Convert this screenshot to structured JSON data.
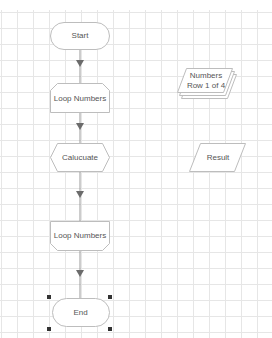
{
  "diagram": {
    "type": "flowchart",
    "colors": {
      "shape_stroke": "#bdbdbd",
      "shape_fill": "#ffffff",
      "connector": "#999999",
      "arrowhead": "#6b6b6b",
      "text": "#555555",
      "grid": "#e6e6e6",
      "selection_handle": "#333333"
    },
    "nodes": [
      {
        "id": "start",
        "shape": "terminator",
        "label": "Start"
      },
      {
        "id": "loop-start",
        "shape": "loop-limit-start",
        "label": "Loop Numbers"
      },
      {
        "id": "calculate",
        "shape": "preparation-hexagon",
        "label": "Calucuate"
      },
      {
        "id": "loop-end",
        "shape": "loop-limit-end",
        "label": "Loop Numbers"
      },
      {
        "id": "end",
        "shape": "terminator",
        "label": "End",
        "selected": true
      },
      {
        "id": "numbers",
        "shape": "multiple-data",
        "label_line1": "Numbers",
        "label_line2": "Row 1 of 4"
      },
      {
        "id": "result",
        "shape": "data-parallelogram",
        "label": "Result"
      }
    ],
    "edges": [
      {
        "from": "start",
        "to": "loop-start"
      },
      {
        "from": "loop-start",
        "to": "calculate"
      },
      {
        "from": "calculate",
        "to": "loop-end"
      },
      {
        "from": "loop-end",
        "to": "end"
      }
    ]
  }
}
